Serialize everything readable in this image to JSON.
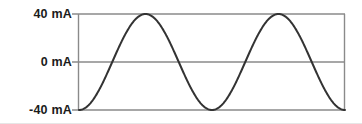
{
  "chart_data": {
    "type": "line",
    "title": "",
    "xlabel": "",
    "ylabel": "",
    "ylim": [
      -40,
      40
    ],
    "xlim": [
      0,
      2
    ],
    "grid": true,
    "legend": null,
    "ytick_labels": [
      "40 mA",
      "0 mA",
      "-40 mA"
    ],
    "ytick_values": [
      40,
      0,
      -40
    ],
    "xtick_labels": [],
    "units": "mA",
    "series": [
      {
        "name": "current",
        "waveform": "sine",
        "amplitude": 40,
        "offset": 0,
        "cycles": 2,
        "phase_deg": -90,
        "start_value": -40,
        "peak_value": 40,
        "trough_value": -40,
        "color": "#333333",
        "line_width": 2,
        "x": [
          0,
          0.125,
          0.25,
          0.375,
          0.5,
          0.625,
          0.75,
          0.875,
          1,
          1.125,
          1.25,
          1.375,
          1.5,
          1.625,
          1.75,
          1.875,
          2
        ],
        "values": [
          -40,
          -28.3,
          0,
          28.3,
          40,
          28.3,
          0,
          -28.3,
          -40,
          -28.3,
          0,
          28.3,
          40,
          28.3,
          0,
          -28.3,
          -40
        ]
      }
    ]
  },
  "axes": {
    "top_label": "40 mA",
    "zero_label": "0 mA",
    "bottom_label": "-40 mA",
    "gridline_color": "#8a8a8a",
    "axis_color": "#8a8a8a",
    "curve_color": "#333333",
    "background_color": "#ffffff"
  }
}
